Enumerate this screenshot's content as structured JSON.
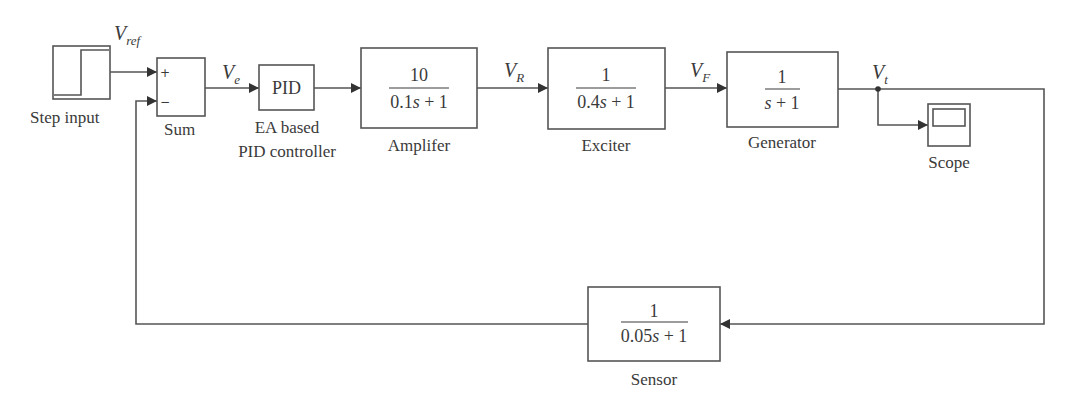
{
  "diagram": {
    "type": "block-diagram",
    "title": "",
    "blocks": {
      "step": {
        "label": "Step input"
      },
      "sum": {
        "label": "Sum",
        "plus": "+",
        "minus": "−"
      },
      "pid": {
        "text": "PID",
        "label_line1": "EA based",
        "label_line2": "PID controller"
      },
      "amplifier": {
        "numerator": "10",
        "denominator_coef": "0.1",
        "denominator_rest": " + 1",
        "label": "Amplifer"
      },
      "exciter": {
        "numerator": "1",
        "denominator_coef": "0.4",
        "denominator_rest": " + 1",
        "label": "Exciter"
      },
      "generator": {
        "numerator": "1",
        "denominator_coef": "",
        "denominator_rest": " + 1",
        "label": "Generator"
      },
      "scope": {
        "label": "Scope"
      },
      "sensor": {
        "numerator": "1",
        "denominator_coef": "0.05",
        "denominator_rest": " + 1",
        "label": "Sensor"
      }
    },
    "signals": {
      "vref": {
        "main": "V",
        "sub": "ref"
      },
      "ve": {
        "main": "V",
        "sub": "e"
      },
      "vr": {
        "main": "V",
        "sub": "R"
      },
      "vf": {
        "main": "V",
        "sub": "F"
      },
      "vt": {
        "main": "V",
        "sub": "t"
      }
    },
    "variable": "s",
    "connections": [
      "Step input -> Sum(+)",
      "Sum -> PID",
      "PID -> Amplifer",
      "Amplifer -> Exciter",
      "Exciter -> Generator",
      "Generator -> Scope",
      "Generator -> Sensor",
      "Sensor -> Sum(-)"
    ],
    "colors": {
      "line": "#555555",
      "text": "#3a3a3a",
      "background": "#ffffff"
    }
  }
}
